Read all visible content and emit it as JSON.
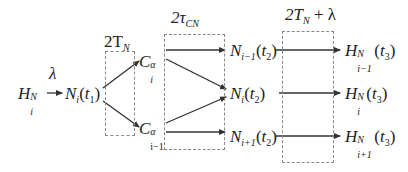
{
  "diagram": {
    "title": "",
    "source": {
      "label_base": "H",
      "label_sup": "N",
      "label_sub": "i",
      "arrow_label": "λ"
    },
    "node_n_t1": {
      "base": "N",
      "sub": "i",
      "arg": "(t",
      "arg_sub": "1",
      "close": ")"
    },
    "stages": [
      {
        "label_main": "2T",
        "label_sub": "N",
        "label_tail": ""
      },
      {
        "label_main": "2τ",
        "label_sub": "CN",
        "label_tail": ""
      },
      {
        "label_main": "2T",
        "label_sub": "N",
        "label_tail": " + λ"
      }
    ],
    "c_nodes": [
      {
        "base": "C",
        "sup": "α",
        "sub": "i"
      },
      {
        "base": "C",
        "sup": "α",
        "sub": "i−1"
      }
    ],
    "n_t2_nodes": [
      {
        "base": "N",
        "sub": "i−1",
        "arg": "(t",
        "arg_sub": "2",
        "close": ")"
      },
      {
        "base": "N",
        "sub": "i",
        "arg": "(t",
        "arg_sub": "2",
        "close": ")"
      },
      {
        "base": "N",
        "sub": "i+1",
        "arg": "(t",
        "arg_sub": "2",
        "close": ")"
      }
    ],
    "h_t3_nodes": [
      {
        "base": "H",
        "sup": "N",
        "sub": "i−1",
        "arg": "(t",
        "arg_sub": "3",
        "close": ")"
      },
      {
        "base": "H",
        "sup": "N",
        "sub": "i",
        "arg": "(t",
        "arg_sub": "3",
        "close": ")"
      },
      {
        "base": "H",
        "sup": "N",
        "sub": "i+1",
        "arg": "(t",
        "arg_sub": "3",
        "close": ")"
      }
    ],
    "edges": [
      {
        "from": "H_i^N",
        "to": "N_i(t1)",
        "label": "λ"
      },
      {
        "from": "N_i(t1)",
        "to": "C_i^α"
      },
      {
        "from": "N_i(t1)",
        "to": "C_{i-1}^α"
      },
      {
        "from": "C_i^α",
        "to": "N_{i-1}(t2)"
      },
      {
        "from": "C_i^α",
        "to": "N_i(t2)"
      },
      {
        "from": "C_{i-1}^α",
        "to": "N_i(t2)"
      },
      {
        "from": "C_{i-1}^α",
        "to": "N_{i+1}(t2)"
      },
      {
        "from": "N_{i-1}(t2)",
        "to": "H_{i-1}^N(t3)"
      },
      {
        "from": "N_i(t2)",
        "to": "H_i^N(t3)"
      },
      {
        "from": "N_{i+1}(t2)",
        "to": "H_{i+1}^N(t3)"
      }
    ],
    "colors": {
      "line": "#333333",
      "box_border": "#888888",
      "text": "#222222"
    }
  }
}
